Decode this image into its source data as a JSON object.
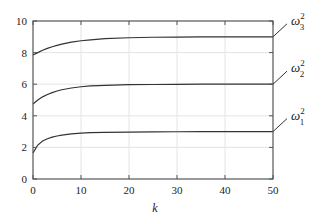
{
  "chart_data": {
    "type": "line",
    "title": "",
    "xlabel": "k",
    "ylabel": "",
    "xlim": [
      0,
      50
    ],
    "ylim": [
      0,
      10
    ],
    "x_ticks": [
      0,
      10,
      20,
      30,
      40,
      50
    ],
    "y_ticks": [
      0,
      2,
      4,
      6,
      8,
      10
    ],
    "grid": true,
    "legend_position": "right, inline labels with leader lines",
    "x": [
      0,
      1,
      2,
      3,
      4,
      5,
      6,
      8,
      10,
      12,
      15,
      20,
      25,
      30,
      35,
      40,
      45,
      50
    ],
    "series": [
      {
        "name": "ω3²",
        "label_base": "ω",
        "label_sup": "2",
        "label_sub": "3",
        "values": [
          7.85,
          8.0,
          8.15,
          8.27,
          8.37,
          8.46,
          8.54,
          8.66,
          8.75,
          8.81,
          8.88,
          8.94,
          8.97,
          8.98,
          8.99,
          9.0,
          9.0,
          9.0
        ]
      },
      {
        "name": "ω2²",
        "label_base": "ω",
        "label_sup": "2",
        "label_sub": "2",
        "values": [
          4.75,
          5.0,
          5.2,
          5.35,
          5.47,
          5.57,
          5.65,
          5.76,
          5.84,
          5.89,
          5.93,
          5.97,
          5.98,
          5.99,
          6.0,
          6.0,
          6.0,
          6.0
        ]
      },
      {
        "name": "ω1²",
        "label_base": "ω",
        "label_sup": "2",
        "label_sub": "1",
        "values": [
          1.65,
          2.15,
          2.4,
          2.55,
          2.65,
          2.72,
          2.78,
          2.85,
          2.9,
          2.93,
          2.95,
          2.97,
          2.98,
          2.99,
          3.0,
          3.0,
          3.0,
          3.0
        ]
      }
    ]
  },
  "labels": {
    "x_ticks": [
      "0",
      "10",
      "20",
      "30",
      "40",
      "50"
    ],
    "y_ticks": [
      "0",
      "2",
      "4",
      "6",
      "8",
      "10"
    ],
    "xlabel": "k"
  },
  "colors": {
    "line": "#333333",
    "axis": "#555555",
    "grid": "#e4e4e4"
  }
}
